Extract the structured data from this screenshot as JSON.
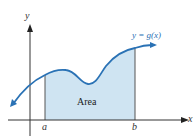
{
  "figure": {
    "y_axis_label": "y",
    "x_axis_label": "x",
    "curve_label": "y = g(x)",
    "area_label": "Area",
    "lower_bound_label": "a",
    "upper_bound_label": "b"
  },
  "colors": {
    "curve": "#2a72b5",
    "area_fill": "#cfe4f2",
    "axis": "#333333",
    "curve_label": "#2a72b5"
  }
}
